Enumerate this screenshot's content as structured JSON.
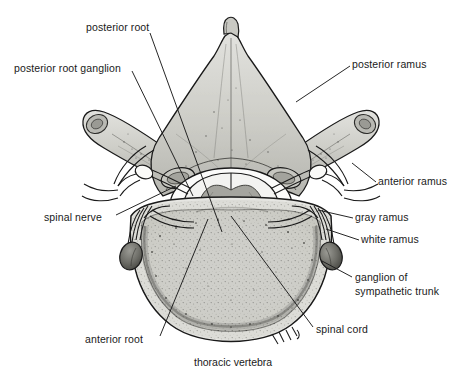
{
  "figure": {
    "caption": "thoracic vertebra",
    "background_color": "#ffffff",
    "ink_color": "#1a1a1a",
    "bone_fill": "#d8d8d4",
    "bone_fill_dark": "#c3c3bd",
    "cord_white_matter": "#f4f4f2",
    "cord_gray_matter": "#a9a9a3",
    "ganglion_fill": "#6f6f6a"
  },
  "labels": [
    {
      "id": "posterior-root",
      "text": "posterior root",
      "x": 86,
      "y": 21,
      "align": "left"
    },
    {
      "id": "posterior-root-ganglion",
      "text": "posterior root ganglion",
      "x": 14,
      "y": 62,
      "align": "left"
    },
    {
      "id": "posterior-ramus",
      "text": "posterior ramus",
      "x": 352,
      "y": 58,
      "align": "left"
    },
    {
      "id": "anterior-ramus",
      "text": "anterior ramus",
      "x": 378,
      "y": 175,
      "align": "left"
    },
    {
      "id": "spinal-nerve",
      "text": "spinal nerve",
      "x": 44,
      "y": 211,
      "align": "left"
    },
    {
      "id": "gray-ramus",
      "text": "gray ramus",
      "x": 355,
      "y": 211,
      "align": "left"
    },
    {
      "id": "white-ramus",
      "text": "white ramus",
      "x": 361,
      "y": 233,
      "align": "left"
    },
    {
      "id": "ganglion-of-sympathetic-trunk",
      "text": "ganglion of sympathetic trunk",
      "x": 355,
      "y": 271,
      "align": "left",
      "multiline": true
    },
    {
      "id": "spinal-cord",
      "text": "spinal cord",
      "x": 316,
      "y": 323,
      "align": "left"
    },
    {
      "id": "anterior-root",
      "text": "anterior root",
      "x": 85,
      "y": 333,
      "align": "left"
    }
  ],
  "caption": {
    "text": "thoracic vertebra",
    "x": 194,
    "y": 356
  },
  "structures": [
    "spinous process",
    "lamina",
    "transverse process",
    "superior articular process",
    "pedicle",
    "vertebral body",
    "vertebral foramen",
    "spinal cord gray matter",
    "spinal cord white matter",
    "dura mater",
    "posterior root",
    "anterior root",
    "posterior root ganglion",
    "spinal nerve",
    "posterior ramus",
    "anterior ramus",
    "gray ramus communicans",
    "white ramus communicans",
    "sympathetic trunk ganglion"
  ]
}
